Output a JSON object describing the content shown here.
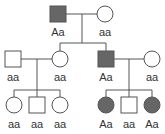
{
  "colors": {
    "affected": "#666666",
    "unaffected": "#ffffff",
    "stroke": "#555555",
    "line": "#555555",
    "text": "#333333"
  },
  "generations": [
    {
      "id": "I",
      "individuals": [
        {
          "id": "I-1",
          "sex": "male",
          "affected": true,
          "genotype": "Aa"
        },
        {
          "id": "I-2",
          "sex": "female",
          "affected": false,
          "genotype": "aa"
        }
      ]
    },
    {
      "id": "II",
      "individuals": [
        {
          "id": "II-1",
          "sex": "male",
          "affected": false,
          "genotype": "aa"
        },
        {
          "id": "II-2",
          "sex": "female",
          "affected": false,
          "genotype": "aa"
        },
        {
          "id": "II-3",
          "sex": "male",
          "affected": true,
          "genotype": "Aa"
        },
        {
          "id": "II-4",
          "sex": "female",
          "affected": false,
          "genotype": "aa"
        }
      ]
    },
    {
      "id": "III",
      "individuals": [
        {
          "id": "III-1",
          "sex": "female",
          "affected": false,
          "genotype": "aa"
        },
        {
          "id": "III-2",
          "sex": "male",
          "affected": false,
          "genotype": "aa"
        },
        {
          "id": "III-3",
          "sex": "female",
          "affected": false,
          "genotype": "aa"
        },
        {
          "id": "III-4",
          "sex": "female",
          "affected": true,
          "genotype": "Aa"
        },
        {
          "id": "III-5",
          "sex": "male",
          "affected": false,
          "genotype": "aa"
        },
        {
          "id": "III-6",
          "sex": "female",
          "affected": true,
          "genotype": "Aa"
        }
      ]
    }
  ],
  "labels": {
    "I1": "Aa",
    "I2": "aa",
    "II1": "aa",
    "II2": "aa",
    "II3": "Aa",
    "II4": "aa",
    "III1": "aa",
    "III2": "aa",
    "III3": "aa",
    "III4": "Aa",
    "III5": "aa",
    "III6": "Aa"
  }
}
